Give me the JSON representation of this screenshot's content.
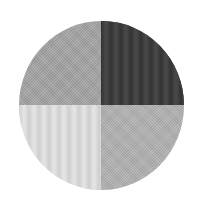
{
  "figure": {
    "shape": "circle",
    "quadrants": [
      {
        "position": "top-left",
        "pattern": "fine-dither",
        "color": "#a6a6a6"
      },
      {
        "position": "top-right",
        "pattern": "vertical-stripes",
        "color": "#3e3e3e"
      },
      {
        "position": "bottom-left",
        "pattern": "vertical-stripes",
        "color": "#d6d6d6"
      },
      {
        "position": "bottom-right",
        "pattern": "fine-dither",
        "color": "#b3b3b3"
      }
    ]
  }
}
